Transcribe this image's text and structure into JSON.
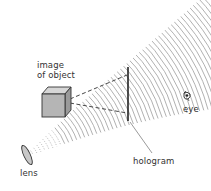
{
  "diagram": {
    "labels": {
      "object_line1": "image",
      "object_line2": "of object",
      "lens": "lens",
      "hologram": "hologram",
      "eye": "eye"
    },
    "colors": {
      "waves": "#a8a8a8",
      "lines": "#333333",
      "cube_front": "#b5b5b5",
      "cube_top": "#d6d6d6",
      "cube_side": "#9a9a9a"
    }
  }
}
